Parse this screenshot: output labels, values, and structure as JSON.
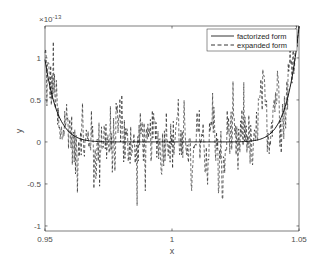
{
  "chart_data": {
    "type": "line",
    "title": "",
    "xlabel": "x",
    "ylabel": "y",
    "y_exponent_label": "×10",
    "y_exponent_power": "-13",
    "xlim": [
      0.95,
      1.05
    ],
    "ylim": [
      -1.06,
      1.38
    ],
    "xticks": [
      0.95,
      1,
      1.05
    ],
    "xtick_labels": [
      "0.95",
      "1",
      "1.05"
    ],
    "yticks": [
      -1,
      -0.5,
      0,
      0.5,
      1
    ],
    "ytick_labels": [
      "-1",
      "-0.5",
      "0",
      "0.5",
      "1"
    ],
    "grid": false,
    "legend_position": "upper right",
    "x": [
      0.95,
      0.952,
      0.954,
      0.956,
      0.958,
      0.96,
      0.962,
      0.964,
      0.966,
      0.968,
      0.97,
      0.972,
      0.974,
      0.976,
      0.978,
      0.98,
      0.982,
      0.984,
      0.986,
      0.988,
      0.99,
      0.992,
      0.994,
      0.996,
      0.998,
      1.0,
      1.002,
      1.004,
      1.006,
      1.008,
      1.01,
      1.012,
      1.014,
      1.016,
      1.018,
      1.02,
      1.022,
      1.024,
      1.026,
      1.028,
      1.03,
      1.032,
      1.034,
      1.036,
      1.038,
      1.04,
      1.042,
      1.044,
      1.046,
      1.048,
      1.05
    ],
    "series": [
      {
        "name": "factorized form",
        "style": "solid",
        "color": "#000000",
        "values": [
          0.98,
          0.64,
          0.41,
          0.26,
          0.16,
          0.1,
          0.06,
          0.04,
          0.02,
          0.01,
          0.01,
          0.0,
          0.0,
          0.0,
          0.0,
          0.0,
          0.0,
          0.0,
          0.0,
          0.0,
          0.0,
          0.0,
          0.0,
          0.0,
          0.0,
          0.0,
          0.0,
          0.0,
          0.0,
          0.0,
          0.0,
          0.0,
          0.0,
          0.0,
          0.0,
          0.0,
          0.0,
          0.0,
          0.0,
          0.0,
          0.01,
          0.01,
          0.02,
          0.04,
          0.06,
          0.1,
          0.16,
          0.26,
          0.41,
          0.64,
          0.98
        ]
      },
      {
        "name": "expanded form",
        "style": "dashed",
        "color": "#000000",
        "values": [
          0.95,
          0.75,
          0.8,
          -0.3,
          0.45,
          0.2,
          -0.45,
          0.3,
          -0.2,
          0.25,
          -0.4,
          0.15,
          0.1,
          -0.35,
          0.35,
          0.6,
          -0.1,
          0.05,
          -0.4,
          0.3,
          -0.25,
          0.15,
          0.2,
          -0.3,
          0.4,
          -0.2,
          0.55,
          -0.3,
          0.2,
          -0.95,
          0.3,
          0.1,
          -0.5,
          0.75,
          -0.4,
          -1.0,
          0.4,
          0.15,
          -0.3,
          0.35,
          0.2,
          -0.55,
          0.5,
          0.95,
          -0.3,
          0.4,
          0.7,
          -0.35,
          0.55,
          0.85,
          1.35
        ]
      }
    ]
  },
  "legend": {
    "items": [
      {
        "label": "factorized form",
        "style": "solid"
      },
      {
        "label": "expanded form",
        "style": "dashed"
      }
    ]
  }
}
